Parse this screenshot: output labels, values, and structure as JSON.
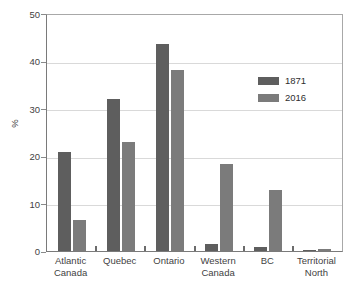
{
  "chart_data": {
    "type": "bar",
    "title": "",
    "subtitle": "",
    "xlabel": "",
    "ylabel": "%",
    "ylim": [
      0,
      50
    ],
    "yticks": [
      0,
      10,
      20,
      30,
      40,
      50
    ],
    "ytick_labels": [
      "0",
      "10",
      "20",
      "30",
      "40",
      "50"
    ],
    "grid": true,
    "grid_axis": "y",
    "legend_position": "upper right",
    "categories": [
      "Atlantic Canada",
      "Quebec",
      "Ontario",
      "Western Canada",
      "BC",
      "Territorial North"
    ],
    "category_lines": [
      [
        "Atlantic",
        "Canada"
      ],
      [
        "Quebec",
        ""
      ],
      [
        "Ontario",
        ""
      ],
      [
        "Western",
        "Canada"
      ],
      [
        "BC",
        ""
      ],
      [
        "Territorial",
        "North"
      ]
    ],
    "series": [
      {
        "name": "1871",
        "color": "#5e5e5e",
        "values": [
          21.0,
          32.3,
          43.8,
          1.5,
          0.9,
          0.3
        ]
      },
      {
        "name": "2016",
        "color": "#7b7b7b",
        "values": [
          6.6,
          23.0,
          38.3,
          18.4,
          13.0,
          0.4
        ]
      }
    ]
  },
  "legend": {
    "items": [
      {
        "label": "1871",
        "color": "#5e5e5e"
      },
      {
        "label": "2016",
        "color": "#7b7b7b"
      }
    ]
  },
  "axis": {
    "y_title": "%",
    "y_ticks": [
      "50",
      "40",
      "30",
      "20",
      "10",
      "0"
    ]
  },
  "colors": {
    "series_1871": "#5e5e5e",
    "series_2016": "#7b7b7b",
    "gridline": "#d9d9d9",
    "axis": "#7a7a7a",
    "text": "#3f3f3f",
    "background": "#ffffff"
  }
}
